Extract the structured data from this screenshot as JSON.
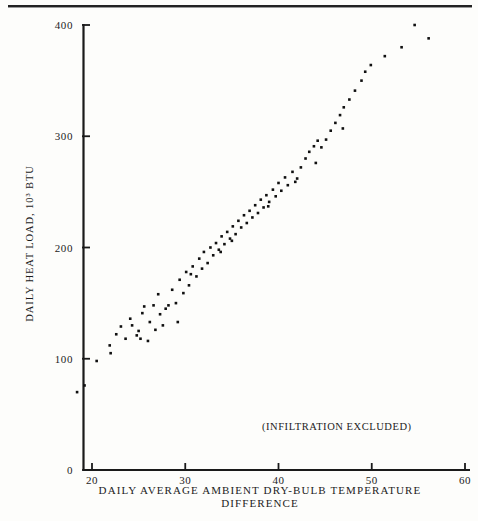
{
  "figure": {
    "note": "(INFILTRATION EXCLUDED)",
    "ink_color": "#101010"
  },
  "axes": {
    "y_title": "DAILY HEAT LOAD, 10³ BTU",
    "x_title_line1": "DAILY AVERAGE AMBIENT DRY-BULB TEMPERATURE",
    "x_title_line2": "DIFFERENCE",
    "y_ticks": [
      "0",
      "100",
      "200",
      "300",
      "400"
    ],
    "x_ticks": [
      "20",
      "30",
      "40",
      "50",
      "60"
    ]
  },
  "chart_data": {
    "type": "scatter",
    "title": "",
    "xlabel": "DAILY AVERAGE AMBIENT DRY-BULB TEMPERATURE DIFFERENCE",
    "ylabel": "DAILY HEAT LOAD, 10³ BTU",
    "xlim": [
      18,
      60
    ],
    "ylim": [
      0,
      400
    ],
    "xticks": [
      20,
      30,
      40,
      50,
      60
    ],
    "yticks": [
      0,
      100,
      200,
      300,
      400
    ],
    "grid": false,
    "legend": null,
    "annotations": [
      {
        "text": "(INFILTRATION EXCLUDED)",
        "x": 39.5,
        "y": 45
      }
    ],
    "marker": {
      "shape": "square",
      "size": 2.6,
      "color": "#101010"
    },
    "points": [
      [
        18.4,
        70
      ],
      [
        19.2,
        76
      ],
      [
        20.5,
        98
      ],
      [
        21.9,
        112
      ],
      [
        22.0,
        105
      ],
      [
        22.6,
        122
      ],
      [
        23.6,
        118
      ],
      [
        24.1,
        136
      ],
      [
        24.3,
        130
      ],
      [
        25.0,
        125
      ],
      [
        25.2,
        118
      ],
      [
        25.4,
        141
      ],
      [
        25.6,
        147
      ],
      [
        26.0,
        116
      ],
      [
        26.2,
        133
      ],
      [
        26.6,
        148
      ],
      [
        26.8,
        126
      ],
      [
        27.1,
        158
      ],
      [
        27.3,
        140
      ],
      [
        27.6,
        130
      ],
      [
        28.2,
        148
      ],
      [
        28.6,
        162
      ],
      [
        29.0,
        150
      ],
      [
        29.2,
        133
      ],
      [
        29.4,
        171
      ],
      [
        29.8,
        159
      ],
      [
        30.1,
        178
      ],
      [
        30.4,
        166
      ],
      [
        30.8,
        183
      ],
      [
        31.2,
        174
      ],
      [
        31.5,
        190
      ],
      [
        31.8,
        181
      ],
      [
        32.0,
        196
      ],
      [
        32.4,
        186
      ],
      [
        32.7,
        200
      ],
      [
        33.0,
        193
      ],
      [
        33.3,
        204
      ],
      [
        33.6,
        198
      ],
      [
        33.9,
        210
      ],
      [
        34.2,
        203
      ],
      [
        34.5,
        214
      ],
      [
        34.8,
        208
      ],
      [
        35.1,
        219
      ],
      [
        35.4,
        212
      ],
      [
        35.7,
        224
      ],
      [
        36.0,
        218
      ],
      [
        36.3,
        229
      ],
      [
        36.6,
        222
      ],
      [
        36.9,
        233
      ],
      [
        37.2,
        227
      ],
      [
        37.5,
        238
      ],
      [
        37.8,
        231
      ],
      [
        38.1,
        243
      ],
      [
        38.4,
        236
      ],
      [
        38.7,
        247
      ],
      [
        39.0,
        241
      ],
      [
        39.4,
        252
      ],
      [
        39.7,
        246
      ],
      [
        40.0,
        258
      ],
      [
        40.3,
        251
      ],
      [
        40.7,
        263
      ],
      [
        41.0,
        256
      ],
      [
        41.5,
        268
      ],
      [
        42.0,
        262
      ],
      [
        42.4,
        272
      ],
      [
        42.9,
        280
      ],
      [
        43.3,
        286
      ],
      [
        43.8,
        291
      ],
      [
        44.2,
        296
      ],
      [
        44.6,
        290
      ],
      [
        45.1,
        297
      ],
      [
        45.6,
        305
      ],
      [
        46.1,
        312
      ],
      [
        46.6,
        319
      ],
      [
        47.0,
        326
      ],
      [
        47.6,
        333
      ],
      [
        48.2,
        341
      ],
      [
        48.9,
        350
      ],
      [
        49.3,
        358
      ],
      [
        49.9,
        364
      ],
      [
        51.4,
        372
      ],
      [
        53.2,
        380
      ],
      [
        54.6,
        400
      ],
      [
        56.1,
        388
      ],
      [
        23.1,
        129
      ],
      [
        24.8,
        121
      ],
      [
        27.9,
        145
      ],
      [
        30.6,
        176
      ],
      [
        33.8,
        196
      ],
      [
        35.0,
        206
      ],
      [
        38.9,
        237
      ],
      [
        41.8,
        259
      ],
      [
        44.0,
        276
      ],
      [
        46.9,
        307
      ]
    ]
  }
}
